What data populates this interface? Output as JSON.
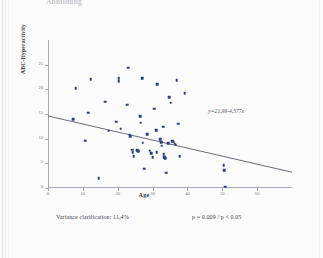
{
  "page": {
    "top_fragment": "Abbildung",
    "bottom_fragment": ""
  },
  "footnotes": {
    "variance": "Variance clarification: 11,4%",
    "pvalue": "p = 0.009 / p < 0.05"
  },
  "chart_data": {
    "type": "scatter",
    "title": "",
    "xlabel": "Age",
    "ylabel": "ABC-Hyperactivity",
    "xlim": [
      0,
      70
    ],
    "ylim": [
      0,
      30
    ],
    "grid": false,
    "legend": null,
    "xticks": [
      0,
      10,
      20,
      30,
      40,
      50,
      60
    ],
    "xticklabels": [
      "0",
      "10",
      "20",
      "30",
      "40",
      "50",
      "60"
    ],
    "yticks": [
      0,
      5,
      10,
      15,
      20,
      25
    ],
    "yticklabels": [
      "0",
      "5",
      "10",
      "15",
      "20",
      "25"
    ],
    "annotation": "y=21,99-4,577x",
    "annotation_x": 46,
    "annotation_y": 16.2,
    "trendline": {
      "type": "linear",
      "x0": 0,
      "y0": 14.6,
      "x1": 70,
      "y1": 3.2,
      "color": "#5a5a66"
    },
    "point_color": "#2f3f7a",
    "points": [
      {
        "x": 8.0,
        "y": 20.2
      },
      {
        "x": 7.2,
        "y": 13.9
      },
      {
        "x": 12.2,
        "y": 22.1
      },
      {
        "x": 11.5,
        "y": 15.3
      },
      {
        "x": 10.6,
        "y": 9.6
      },
      {
        "x": 14.6,
        "y": 2.0
      },
      {
        "x": 16.4,
        "y": 17.5
      },
      {
        "x": 17.4,
        "y": 11.6
      },
      {
        "x": 19.6,
        "y": 13.4
      },
      {
        "x": 20.3,
        "y": 22.3
      },
      {
        "x": 20.3,
        "y": 21.6
      },
      {
        "x": 20.8,
        "y": 12.0
      },
      {
        "x": 22.7,
        "y": 16.9
      },
      {
        "x": 23.0,
        "y": 24.4
      },
      {
        "x": 23.4,
        "y": 10.8
      },
      {
        "x": 23.6,
        "y": 10.5
      },
      {
        "x": 24.2,
        "y": 7.8
      },
      {
        "x": 24.3,
        "y": 7.2
      },
      {
        "x": 24.6,
        "y": 6.5
      },
      {
        "x": 25.6,
        "y": 7.7
      },
      {
        "x": 25.9,
        "y": 7.5
      },
      {
        "x": 26.4,
        "y": 14.5
      },
      {
        "x": 26.6,
        "y": 13.2
      },
      {
        "x": 27.0,
        "y": 22.2
      },
      {
        "x": 27.2,
        "y": 9.2
      },
      {
        "x": 27.6,
        "y": 3.9
      },
      {
        "x": 28.4,
        "y": 10.9
      },
      {
        "x": 29.2,
        "y": 7.6
      },
      {
        "x": 29.6,
        "y": 7.0
      },
      {
        "x": 30.0,
        "y": 6.3
      },
      {
        "x": 30.4,
        "y": 16.1
      },
      {
        "x": 31.0,
        "y": 11.7
      },
      {
        "x": 31.2,
        "y": 7.2
      },
      {
        "x": 31.4,
        "y": 21.0
      },
      {
        "x": 32.2,
        "y": 9.9
      },
      {
        "x": 32.4,
        "y": 9.3
      },
      {
        "x": 32.6,
        "y": 8.6
      },
      {
        "x": 33.0,
        "y": 12.4
      },
      {
        "x": 33.2,
        "y": 6.8
      },
      {
        "x": 33.4,
        "y": 6.2
      },
      {
        "x": 33.6,
        "y": 6.0
      },
      {
        "x": 33.9,
        "y": 3.1
      },
      {
        "x": 34.4,
        "y": 9.1
      },
      {
        "x": 34.8,
        "y": 18.4
      },
      {
        "x": 35.2,
        "y": 17.3
      },
      {
        "x": 35.6,
        "y": 9.5
      },
      {
        "x": 36.1,
        "y": 9.4
      },
      {
        "x": 36.4,
        "y": 9.0
      },
      {
        "x": 36.6,
        "y": 8.8
      },
      {
        "x": 36.9,
        "y": 21.9
      },
      {
        "x": 37.4,
        "y": 13.0
      },
      {
        "x": 37.8,
        "y": 6.4
      },
      {
        "x": 39.2,
        "y": 19.2
      },
      {
        "x": 50.4,
        "y": 4.6
      },
      {
        "x": 50.6,
        "y": 3.6
      },
      {
        "x": 50.8,
        "y": 0.3
      }
    ]
  }
}
